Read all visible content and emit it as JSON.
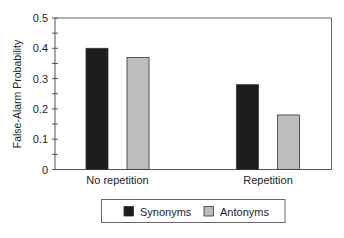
{
  "chart_data": {
    "type": "bar",
    "title": "",
    "xlabel": "",
    "ylabel": "False-Alarm Probability",
    "ylim": [
      0,
      0.5
    ],
    "yticks": [
      0,
      0.1,
      0.2,
      0.3,
      0.4,
      0.5
    ],
    "ytick_labels": [
      "0",
      "0.1",
      "0.2",
      "0.3",
      "0.4",
      "0.5"
    ],
    "minor_ytick_step": 0.05,
    "grid": false,
    "categories": [
      "No repetition",
      "Repetition"
    ],
    "series": [
      {
        "name": "Synonyms",
        "values": [
          0.4,
          0.28
        ],
        "color": "#1c1c1c"
      },
      {
        "name": "Antonyms",
        "values": [
          0.37,
          0.18
        ],
        "color": "#bdbdbd"
      }
    ],
    "legend": {
      "position": "bottom",
      "entries": [
        "Synonyms",
        "Antonyms"
      ]
    }
  }
}
